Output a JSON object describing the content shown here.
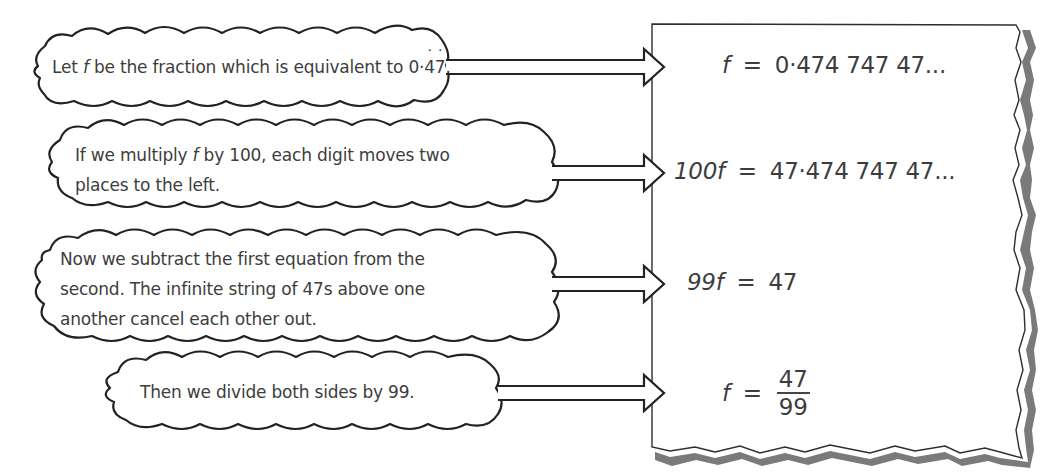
{
  "steps": [
    {
      "bubble": {
        "lines": [
          "Let f be the fraction which is equivalent to 0·47."
        ],
        "parts": {
          "pre": "Let ",
          "var": "f",
          "mid": " be the fraction which is equivalent to 0·",
          "rep1": "4",
          "rep2": "7",
          "post": "."
        }
      },
      "equation": {
        "lhs_var": "f",
        "equals": "=",
        "rhs": "0·474 747 47..."
      }
    },
    {
      "bubble": {
        "lines": [
          "If we multiply f by 100, each digit moves two",
          "places to the left."
        ],
        "parts": {
          "pre": "If we multiply ",
          "var": "f",
          "post": " by 100, each digit moves two",
          "line2": "places to the left."
        }
      },
      "equation": {
        "lhs_coef": "100",
        "lhs_var": "f",
        "equals": "=",
        "rhs": "47·474 747 47..."
      }
    },
    {
      "bubble": {
        "lines": [
          "Now we subtract the first equation from the",
          "second. The infinite string of 47s above one",
          "another cancel each other out."
        ]
      },
      "equation": {
        "lhs_coef": "99",
        "lhs_var": "f",
        "equals": "=",
        "rhs": "47"
      }
    },
    {
      "bubble": {
        "lines": [
          "Then we divide both sides by 99."
        ]
      },
      "equation": {
        "lhs_var": "f",
        "equals": "=",
        "numerator": "47",
        "denominator": "99"
      }
    }
  ],
  "colors": {
    "outline": "#2a2a2a",
    "text": "#3d3d3d",
    "shadow": "#6e6e6e",
    "background": "#ffffff"
  }
}
